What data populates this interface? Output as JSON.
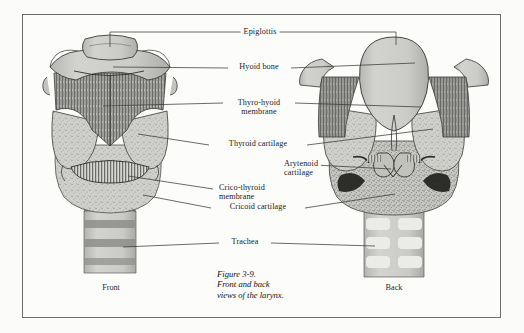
{
  "figure": {
    "caption_lines": [
      "Figure 3-9.",
      "Front and back",
      "views of the larynx."
    ],
    "view_left": "Front",
    "view_right": "Back",
    "labels": [
      {
        "id": "epiglottis",
        "text": "Epiglottis"
      },
      {
        "id": "hyoid-bone",
        "text": "Hyoid bone"
      },
      {
        "id": "thyro-hyoid-membrane",
        "line1": "Thyro-hyoid",
        "line2": "membrane"
      },
      {
        "id": "thyroid-cartilage",
        "text": "Thyroid cartilage"
      },
      {
        "id": "arytenoid-cartilage",
        "line1": "Arytenoid",
        "line2": "cartilage"
      },
      {
        "id": "crico-thyroid-membrane",
        "line1": "Crico-thyroid",
        "line2": "membrane"
      },
      {
        "id": "cricoid-cartilage",
        "text": "Cricoid cartilage"
      },
      {
        "id": "trachea",
        "text": "Trachea"
      }
    ]
  },
  "colors": {
    "frame": "#6d6d6d",
    "page": "#fbfbfa",
    "cartilage_fill": "#c9c9c6",
    "cartilage_light": "#d9d9d6",
    "cartilage_shadow": "#a9a9a6",
    "membrane": "#8f8f8c",
    "trachea_band": "#8d8d8a",
    "ink": "#1b1b1b",
    "leader": "#3a3a3a"
  }
}
